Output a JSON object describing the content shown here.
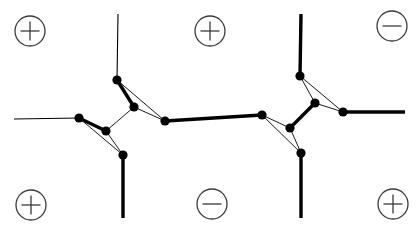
{
  "figure": {
    "title": "",
    "width": 420,
    "height": 231,
    "background": "#ffffff"
  },
  "style": {
    "edge_color": "#000000",
    "node_color": "#000000",
    "charge_ring_color": "#3a3a3a",
    "thin_edge_width": 1.1,
    "thick_edge_width": 3.4,
    "hairline_edge_width": 0.9,
    "node_radius": 4.6
  },
  "charges": [
    {
      "id": "charge-tl",
      "sign": "+",
      "symbol": "⊕",
      "x": 30,
      "y": 31
    },
    {
      "id": "charge-tc",
      "sign": "+",
      "symbol": "⊕",
      "x": 210,
      "y": 31
    },
    {
      "id": "charge-tr",
      "sign": "-",
      "symbol": "⊖",
      "x": 392,
      "y": 26
    },
    {
      "id": "charge-bl",
      "sign": "+",
      "symbol": "⊕",
      "x": 31,
      "y": 205
    },
    {
      "id": "charge-bc",
      "sign": "-",
      "symbol": "⊖",
      "x": 212,
      "y": 204
    },
    {
      "id": "charge-br",
      "sign": "+",
      "symbol": "⊕",
      "x": 393,
      "y": 204
    }
  ],
  "nodes": [
    {
      "id": "n1",
      "label": "left-cluster-top",
      "x": 117,
      "y": 80
    },
    {
      "id": "n2",
      "label": "left-cluster-west",
      "x": 79,
      "y": 118
    },
    {
      "id": "n3",
      "label": "left-cluster-inner",
      "x": 106,
      "y": 131
    },
    {
      "id": "n4",
      "label": "left-cluster-east",
      "x": 134,
      "y": 107
    },
    {
      "id": "n5",
      "label": "left-cluster-bottom",
      "x": 123,
      "y": 155
    },
    {
      "id": "n6",
      "label": "bridge-left",
      "x": 165,
      "y": 121
    },
    {
      "id": "n7",
      "label": "bridge-right",
      "x": 262,
      "y": 115
    },
    {
      "id": "n8",
      "label": "right-cluster-top",
      "x": 300,
      "y": 76
    },
    {
      "id": "n9",
      "label": "right-cluster-inner",
      "x": 315,
      "y": 103
    },
    {
      "id": "n10",
      "label": "right-cluster-west",
      "x": 290,
      "y": 128
    },
    {
      "id": "n11",
      "label": "right-cluster-east",
      "x": 343,
      "y": 112
    },
    {
      "id": "n12",
      "label": "right-cluster-bottom",
      "x": 301,
      "y": 153
    }
  ],
  "edges": [
    {
      "id": "e-top-left-lead",
      "from": [
        118,
        14
      ],
      "to": [
        117,
        80
      ],
      "weight": "thin"
    },
    {
      "id": "e-left-lead",
      "from": [
        14,
        119
      ],
      "to": [
        79,
        118
      ],
      "weight": "thin"
    },
    {
      "id": "e-bottom-left-lead",
      "from": [
        123,
        155
      ],
      "to": [
        123,
        218
      ],
      "weight": "thick"
    },
    {
      "id": "e-top-right-lead",
      "from": [
        301,
        14
      ],
      "to": [
        300,
        76
      ],
      "weight": "thick"
    },
    {
      "id": "e-right-lead",
      "from": [
        343,
        112
      ],
      "to": [
        405,
        112
      ],
      "weight": "thick"
    },
    {
      "id": "e-bottom-right-lead",
      "from": [
        301,
        153
      ],
      "to": [
        301,
        218
      ],
      "weight": "thick"
    },
    {
      "id": "e-n1-n4",
      "from": [
        117,
        80
      ],
      "to": [
        134,
        107
      ],
      "weight": "thick"
    },
    {
      "id": "e-n1-n6",
      "from": [
        117,
        80
      ],
      "to": [
        165,
        121
      ],
      "weight": "hairline"
    },
    {
      "id": "e-n4-n6",
      "from": [
        134,
        107
      ],
      "to": [
        165,
        121
      ],
      "weight": "hairline"
    },
    {
      "id": "e-n4-n3",
      "from": [
        134,
        107
      ],
      "to": [
        106,
        131
      ],
      "weight": "hairline"
    },
    {
      "id": "e-n2-n3",
      "from": [
        79,
        118
      ],
      "to": [
        106,
        131
      ],
      "weight": "thick"
    },
    {
      "id": "e-n2-n5",
      "from": [
        79,
        118
      ],
      "to": [
        123,
        155
      ],
      "weight": "hairline"
    },
    {
      "id": "e-n3-n5",
      "from": [
        106,
        131
      ],
      "to": [
        123,
        155
      ],
      "weight": "hairline"
    },
    {
      "id": "e-n6-n7",
      "from": [
        165,
        121
      ],
      "to": [
        262,
        115
      ],
      "weight": "thick"
    },
    {
      "id": "e-n7-n10",
      "from": [
        262,
        115
      ],
      "to": [
        290,
        128
      ],
      "weight": "hairline"
    },
    {
      "id": "e-n7-n12",
      "from": [
        262,
        115
      ],
      "to": [
        301,
        153
      ],
      "weight": "hairline"
    },
    {
      "id": "e-n10-n12",
      "from": [
        290,
        128
      ],
      "to": [
        301,
        153
      ],
      "weight": "hairline"
    },
    {
      "id": "e-n10-n9",
      "from": [
        290,
        128
      ],
      "to": [
        315,
        103
      ],
      "weight": "thick"
    },
    {
      "id": "e-n8-n9",
      "from": [
        300,
        76
      ],
      "to": [
        315,
        103
      ],
      "weight": "hairline"
    },
    {
      "id": "e-n8-n11",
      "from": [
        300,
        76
      ],
      "to": [
        343,
        112
      ],
      "weight": "hairline"
    },
    {
      "id": "e-n9-n11",
      "from": [
        315,
        103
      ],
      "to": [
        343,
        112
      ],
      "weight": "hairline"
    }
  ]
}
